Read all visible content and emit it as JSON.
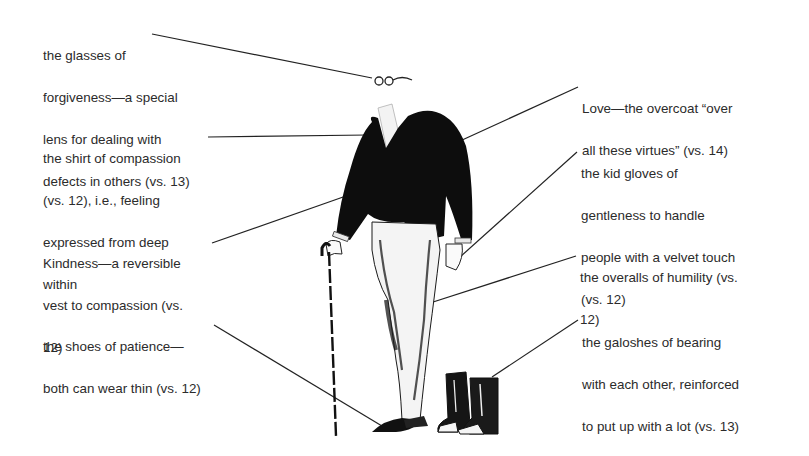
{
  "diagram": {
    "callouts": [
      {
        "id": "glasses",
        "lines": [
          "the glasses of",
          "forgiveness—a special",
          "lens for dealing with",
          "defects in others (vs. 13)"
        ],
        "side": "left"
      },
      {
        "id": "shirt",
        "lines": [
          "the shirt of compassion",
          "(vs. 12), i.e., feeling",
          "expressed from deep",
          "within"
        ],
        "side": "left"
      },
      {
        "id": "vest",
        "lines": [
          "Kindness—a reversible",
          "vest to compassion (vs.",
          "12)"
        ],
        "side": "left"
      },
      {
        "id": "shoes",
        "lines": [
          "the shoes of patience—",
          "both can wear thin (vs. 12)"
        ],
        "side": "left"
      },
      {
        "id": "overcoat",
        "lines": [
          "Love—the overcoat “over",
          "all these virtues” (vs. 14)"
        ],
        "side": "right"
      },
      {
        "id": "gloves",
        "lines": [
          "the kid gloves of",
          "gentleness to handle",
          "people with a velvet touch",
          "(vs. 12)"
        ],
        "side": "right"
      },
      {
        "id": "overalls",
        "lines": [
          "the overalls of humility (vs.",
          "12)"
        ],
        "side": "right"
      },
      {
        "id": "galoshes",
        "lines": [
          "the galoshes of bearing",
          "with each other, reinforced",
          "to put up with a lot (vs. 13)"
        ],
        "side": "right"
      }
    ],
    "colors": {
      "ink": "#111111",
      "text": "#2b2b2b",
      "background": "#ffffff"
    }
  }
}
